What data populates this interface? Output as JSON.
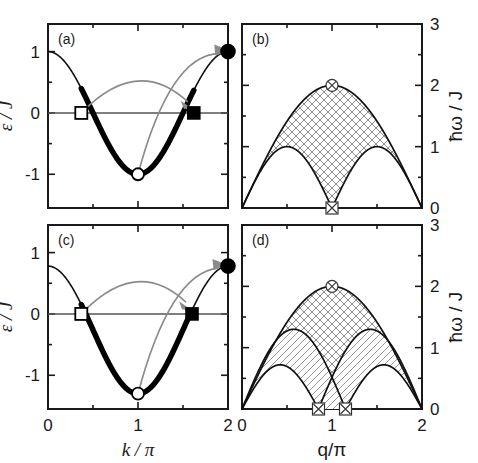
{
  "figure": {
    "background": "#ffffff",
    "ink": "#1a1a1a",
    "arrow_color": "#8a8a8a"
  },
  "panels": {
    "a": {
      "label": "(a)",
      "xlabel": "k / π",
      "ylabel": "ε / J",
      "xticks": [
        "0",
        "1",
        "2"
      ],
      "yticks": [
        "1",
        "0",
        "-1"
      ]
    },
    "b": {
      "label": "(b)",
      "xlabel": "q/π",
      "ylabel": "ħω / J",
      "xticks": [
        "0",
        "1",
        "2"
      ],
      "yticks": [
        "3",
        "2",
        "1",
        "0"
      ]
    },
    "c": {
      "label": "(c)",
      "xlabel": "k / π",
      "ylabel": "ε / J",
      "xticks": [
        "0",
        "1",
        "2"
      ],
      "yticks": [
        "1",
        "0",
        "-1"
      ]
    },
    "d": {
      "label": "(d)",
      "xlabel": "q/π",
      "ylabel": "ħω / J",
      "xticks": [
        "0",
        "1",
        "2"
      ],
      "yticks": [
        "3",
        "2",
        "1",
        "0"
      ]
    }
  },
  "chart_data": [
    {
      "id": "a",
      "type": "line",
      "title": "(a)",
      "xlabel": "k / π",
      "ylabel": "ε / J",
      "xlim": [
        0,
        2
      ],
      "ylim": [
        -1.55,
        1.45
      ],
      "xticks": [
        0,
        1,
        2
      ],
      "xtick_labels": [
        "0",
        "1",
        "2"
      ],
      "xminor": [
        0.5,
        1.5
      ],
      "yticks": [
        1,
        0,
        -1
      ],
      "ytick_labels": [
        "1",
        "0",
        "-1"
      ],
      "yminor": [
        0.5,
        -0.5
      ],
      "grid": false,
      "legend": "none",
      "series": [
        {
          "name": "dispersion",
          "formula": "eps = -cos(pi*x)",
          "note": "epsilon/J = -cos(k) with k in units of pi; amplitude 1.0",
          "amplitude": 1.0,
          "x_start": 0,
          "x_end": 2,
          "y_at_0": 1.0,
          "y_at_1": -1.0,
          "y_at_2": 1.0
        },
        {
          "name": "occupied-band-thick",
          "note": "thick segment marking filled states between the two Fermi points",
          "x_start": 0.37,
          "x_end": 1.62
        }
      ],
      "markers": [
        {
          "name": "open-square",
          "style": "open square",
          "x": 0.37,
          "y": 0.0
        },
        {
          "name": "filled-square",
          "style": "filled square",
          "x": 1.62,
          "y": 0.0
        },
        {
          "name": "open-circle",
          "style": "open circle",
          "x": 1.0,
          "y": -1.0
        },
        {
          "name": "filled-circle",
          "style": "filled circle",
          "x": 2.0,
          "y": 1.0
        }
      ],
      "annotations": [
        {
          "name": "arrow-square-to-square",
          "from": [
            0.37,
            0.0
          ],
          "to": [
            1.62,
            0.05
          ],
          "style": "curved gray arrow"
        },
        {
          "name": "arrow-circle-to-circle",
          "from": [
            1.0,
            -1.0
          ],
          "to": [
            1.97,
            1.0
          ],
          "style": "curved gray arrow"
        }
      ]
    },
    {
      "id": "b",
      "type": "area",
      "title": "(b)",
      "xlabel": "q/π",
      "ylabel": "ħω / J",
      "xlim": [
        0,
        2
      ],
      "ylim": [
        0,
        3
      ],
      "xticks": [
        0,
        1,
        2
      ],
      "xtick_labels": [
        "0",
        "1",
        "2"
      ],
      "xminor": [
        0.5,
        1.5
      ],
      "yticks": [
        0,
        1,
        2,
        3
      ],
      "ytick_labels": [
        "0",
        "1",
        "2",
        "3"
      ],
      "yminor": [
        0.5,
        1.5,
        2.5
      ],
      "grid": false,
      "legend": "none",
      "regions": [
        {
          "name": "two-spinon-continuum",
          "hatch": "crosshatch",
          "upper_formula": "2*sin(pi*x/2)",
          "upper_peak": {
            "x": 1.0,
            "y": 2.0
          },
          "lower_formula": "abs(sin(pi*x))",
          "lower_peaks": [
            {
              "x": 0.5,
              "y": 1.0
            },
            {
              "x": 1.5,
              "y": 1.0
            }
          ],
          "lower_zero_at": [
            0.0,
            1.0,
            2.0
          ]
        }
      ],
      "markers": [
        {
          "name": "crossed-circle-top",
          "style": "crossed circle",
          "x": 1.0,
          "y": 2.0
        },
        {
          "name": "crossed-square-bottom",
          "style": "crossed square",
          "x": 1.0,
          "y": 0.0
        }
      ]
    },
    {
      "id": "c",
      "type": "line",
      "title": "(c)",
      "xlabel": "k / π",
      "ylabel": "ε / J",
      "xlim": [
        0,
        2
      ],
      "ylim": [
        -1.55,
        1.45
      ],
      "xticks": [
        0,
        1,
        2
      ],
      "xtick_labels": [
        "0",
        "1",
        "2"
      ],
      "xminor": [
        0.5,
        1.5
      ],
      "yticks": [
        1,
        0,
        -1
      ],
      "ytick_labels": [
        "1",
        "0",
        "-1"
      ],
      "yminor": [
        0.5,
        -0.5
      ],
      "grid": false,
      "legend": "none",
      "series": [
        {
          "name": "dispersion",
          "formula": "eps = A - B*cos(pi*x)",
          "note": "shifted/asymmetric band: value at k=0 is 0.78, minimum -1.30, value at k=2 is 0.78",
          "y_at_0": 0.78,
          "y_at_1": -1.3,
          "y_at_2": 0.78
        },
        {
          "name": "occupied-band-thick",
          "note": "thick segment marking filled states between the two Fermi points",
          "x_start": 0.37,
          "x_end": 1.6
        }
      ],
      "markers": [
        {
          "name": "open-square",
          "style": "open square",
          "x": 0.37,
          "y": 0.0
        },
        {
          "name": "filled-square",
          "style": "filled square",
          "x": 1.6,
          "y": 0.0
        },
        {
          "name": "open-circle",
          "style": "open circle",
          "x": 1.0,
          "y": -1.3
        },
        {
          "name": "filled-circle",
          "style": "filled circle",
          "x": 2.0,
          "y": 0.78
        }
      ],
      "annotations": [
        {
          "name": "arrow-square-to-square",
          "from": [
            0.37,
            0.0
          ],
          "to": [
            1.6,
            0.06
          ],
          "style": "curved gray arrow"
        },
        {
          "name": "arrow-circle-to-circle",
          "from": [
            1.0,
            -1.3
          ],
          "to": [
            1.95,
            0.78
          ],
          "style": "curved gray arrow"
        }
      ]
    },
    {
      "id": "d",
      "type": "area",
      "title": "(d)",
      "xlabel": "q/π",
      "ylabel": "ħω / J",
      "xlim": [
        0,
        2
      ],
      "ylim": [
        0,
        3
      ],
      "xticks": [
        0,
        1,
        2
      ],
      "xtick_labels": [
        "0",
        "1",
        "2"
      ],
      "xminor": [
        0.5,
        1.5
      ],
      "yticks": [
        0,
        1,
        2,
        3
      ],
      "ytick_labels": [
        "0",
        "1",
        "2",
        "3"
      ],
      "yminor": [
        0.5,
        1.5,
        2.5
      ],
      "grid": false,
      "legend": "none",
      "regions": [
        {
          "name": "upper-continuum",
          "hatch": "crosshatch",
          "upper_formula": "2*sin(pi*x/2)",
          "upper_peak": {
            "x": 1.0,
            "y": 2.0
          },
          "lower_note": "two arches peaking at 1.3 with zeros at 0, 0.85, 1.15, 2"
        },
        {
          "name": "lower-continuum",
          "hatch": "diagonal-lines",
          "upper_peaks": [
            {
              "x": 0.6,
              "y": 1.3
            },
            {
              "x": 1.4,
              "y": 1.3
            }
          ],
          "lower_peaks": [
            {
              "x": 0.45,
              "y": 0.72
            },
            {
              "x": 1.55,
              "y": 0.72
            }
          ],
          "zeros": [
            0.0,
            0.85,
            1.15,
            2.0
          ]
        }
      ],
      "markers": [
        {
          "name": "crossed-circle-top",
          "style": "crossed circle",
          "x": 1.0,
          "y": 2.0
        },
        {
          "name": "crossed-square-left",
          "style": "crossed square",
          "x": 0.85,
          "y": 0.0
        },
        {
          "name": "crossed-square-right",
          "style": "crossed square",
          "x": 1.15,
          "y": 0.0
        }
      ]
    }
  ]
}
